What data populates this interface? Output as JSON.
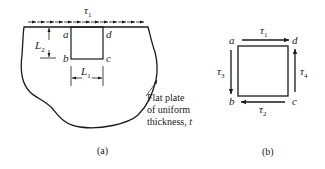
{
  "figure_a": {
    "caption": "(a)",
    "shear_label": "τ",
    "shear_sub": "1",
    "corner_a": "a",
    "corner_b": "b",
    "corner_c": "c",
    "corner_d": "d",
    "dim_L2": "L",
    "dim_L2_sub": "2",
    "dim_L1": "L",
    "dim_L1_sub": "1",
    "note_line1": "Flat plate",
    "note_line2": "of uniform",
    "note_line3": "thickness,",
    "note_t": "t"
  },
  "figure_b": {
    "caption": "(b)",
    "corner_a": "a",
    "corner_b": "b",
    "corner_c": "c",
    "corner_d": "d",
    "tau1": "τ",
    "tau1_sub": "1",
    "tau2": "τ",
    "tau2_sub": "2",
    "tau3": "τ",
    "tau3_sub": "3",
    "tau4": "τ",
    "tau4_sub": "4"
  },
  "colors": {
    "ink": "#1a1a1a",
    "background": "#ffffff"
  }
}
